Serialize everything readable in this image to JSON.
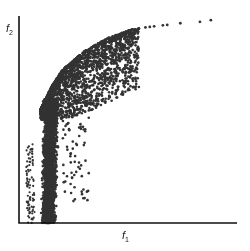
{
  "chart_data": {
    "type": "scatter",
    "title": "",
    "xlabel": "f1",
    "ylabel": "f2",
    "x_tick_labels": [],
    "y_tick_labels": [],
    "grid": false,
    "legend": null,
    "xlim": [
      0,
      1
    ],
    "ylim": [
      0,
      1
    ],
    "front": {
      "x": [
        0.05,
        0.1,
        0.15,
        0.2,
        0.3,
        0.4,
        0.5,
        0.6,
        0.7,
        0.8,
        0.88
      ],
      "y": [
        0.3,
        0.55,
        0.66,
        0.74,
        0.83,
        0.89,
        0.93,
        0.95,
        0.96,
        0.97,
        0.98
      ]
    },
    "colors": {
      "points": "#333333",
      "axes": "#111111"
    }
  },
  "labels": {
    "x": "f",
    "x_sub": "1",
    "y": "f",
    "y_sub": "2"
  }
}
